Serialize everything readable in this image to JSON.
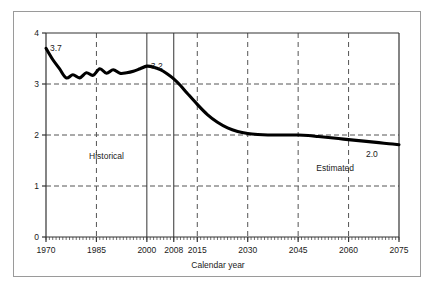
{
  "chart_data": {
    "type": "line",
    "title": "",
    "xlabel": "Calendar year",
    "ylabel": "",
    "xlim": [
      1970,
      2075
    ],
    "ylim": [
      0,
      4
    ],
    "grid": true,
    "legend": "none",
    "x_ticks": [
      "1970",
      "1985",
      "2000",
      "2008",
      "2015",
      "2030",
      "2045",
      "2060",
      "2075"
    ],
    "x_tick_values": [
      1970,
      1985,
      2000,
      2008,
      2015,
      2030,
      2045,
      2060,
      2075
    ],
    "y_ticks": [
      "0",
      "1",
      "2",
      "3",
      "4"
    ],
    "y_tick_values": [
      0,
      1,
      2,
      3,
      4
    ],
    "series": [
      {
        "name": "Total fertility rate",
        "x": [
          1970,
          1972,
          1974,
          1976,
          1978,
          1980,
          1982,
          1984,
          1986,
          1988,
          1990,
          1992,
          1994,
          1996,
          1998,
          2000,
          2002,
          2004,
          2006,
          2008,
          2010,
          2012,
          2015,
          2018,
          2021,
          2024,
          2027,
          2030,
          2033,
          2036,
          2039,
          2042,
          2045,
          2048,
          2051,
          2054,
          2057,
          2060,
          2063,
          2066,
          2069,
          2072,
          2075
        ],
        "y": [
          3.7,
          3.48,
          3.3,
          3.12,
          3.18,
          3.12,
          3.22,
          3.17,
          3.3,
          3.21,
          3.28,
          3.21,
          3.22,
          3.25,
          3.3,
          3.35,
          3.33,
          3.28,
          3.2,
          3.1,
          2.97,
          2.82,
          2.6,
          2.4,
          2.25,
          2.14,
          2.07,
          2.03,
          2.01,
          2.0,
          2.0,
          2.0,
          2.0,
          1.99,
          1.97,
          1.95,
          1.93,
          1.91,
          1.89,
          1.87,
          1.85,
          1.83,
          1.81
        ]
      }
    ],
    "point_labels": [
      {
        "name": "start-value",
        "text": "3.7",
        "x": 1970,
        "y": 3.7
      },
      {
        "name": "year-2000-value",
        "text": "3.2",
        "x": 2000,
        "y": 3.35
      },
      {
        "name": "end-value",
        "text": "2.0",
        "x": 2064,
        "y": 1.62
      }
    ],
    "region_labels": [
      {
        "name": "historical-region",
        "text": "Historical",
        "x": 1988,
        "y": 1.52
      },
      {
        "name": "estimated-region",
        "text": "Estimated",
        "x": 2056,
        "y": 1.3
      }
    ],
    "vertical_markers": [
      {
        "name": "year-2000-marker",
        "value": 2000,
        "style": "solid"
      },
      {
        "name": "year-2008-marker",
        "value": 2008,
        "style": "solid"
      }
    ],
    "colors": {
      "line": "#000000",
      "grid": "#555555",
      "axis": "#333333",
      "frame": "#9a9a9a",
      "background": "#ffffff",
      "text": "#1a1a1a"
    }
  }
}
